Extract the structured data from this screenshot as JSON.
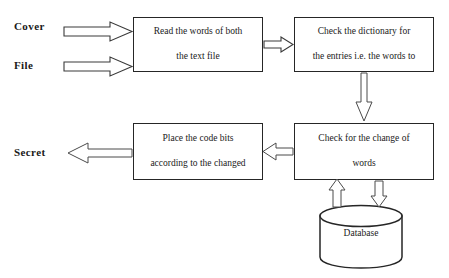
{
  "diagram": {
    "background": "#ffffff",
    "stroke_color": "#262626",
    "labels": {
      "cover": "Cover",
      "file": "File",
      "secret": "Secret"
    },
    "boxes": [
      {
        "id": "read",
        "line1": "Read the words of both",
        "line2": "the text file"
      },
      {
        "id": "dictionary",
        "line1": "Check the dictionary for",
        "line2": "the entries i.e. the words to"
      },
      {
        "id": "place",
        "line1": "Place the code bits",
        "line2": "according to the changed"
      },
      {
        "id": "check",
        "line1": "Check for the change of",
        "line2": "words"
      }
    ],
    "datastore": {
      "label": "Database"
    },
    "connectors": [
      {
        "name": "cover-to-read",
        "direction": "right",
        "style": "block"
      },
      {
        "name": "file-to-read",
        "direction": "right",
        "style": "block"
      },
      {
        "name": "read-to-dictionary",
        "direction": "right",
        "style": "block"
      },
      {
        "name": "dictionary-to-check",
        "direction": "down",
        "style": "thin"
      },
      {
        "name": "check-to-place",
        "direction": "left",
        "style": "thin"
      },
      {
        "name": "place-to-secret",
        "direction": "left",
        "style": "thin"
      },
      {
        "name": "database-to-check",
        "direction": "up",
        "style": "thin"
      },
      {
        "name": "check-to-database",
        "direction": "down",
        "style": "thin"
      }
    ]
  }
}
